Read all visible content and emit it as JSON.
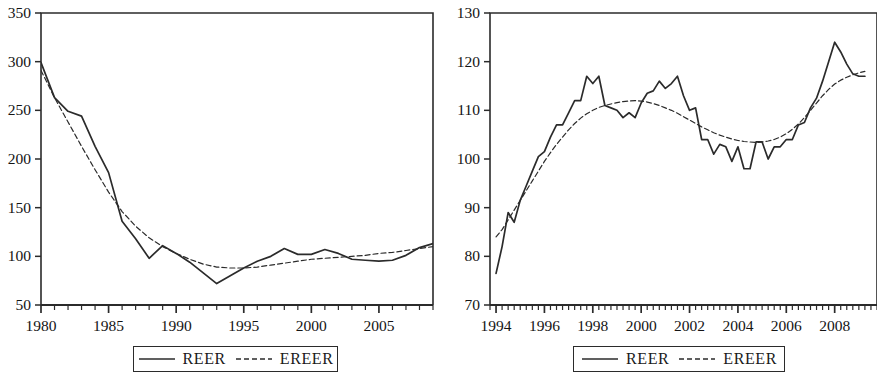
{
  "figure": {
    "background": "#ffffff",
    "line_color": "#2b2b2b",
    "panel_count": 2
  },
  "legend": {
    "series": [
      {
        "label": "REER",
        "style": "solid"
      },
      {
        "label": "EREER",
        "style": "dashed"
      }
    ]
  },
  "chart_data": [
    {
      "type": "line",
      "title": "",
      "xlabel": "",
      "ylabel": "",
      "xlim": [
        1980,
        2009
      ],
      "ylim": [
        50,
        350
      ],
      "grid": false,
      "legend_position": "bottom",
      "ytick_labels": [
        "350",
        "300",
        "250",
        "200",
        "150",
        "100",
        "50"
      ],
      "ytick_values": [
        350,
        300,
        250,
        200,
        150,
        100,
        50
      ],
      "xtick_labels": [
        "1980",
        "1985",
        "1990",
        "1995",
        "2000",
        "2005"
      ],
      "xtick_values": [
        1980,
        1985,
        1990,
        1995,
        2000,
        2005
      ],
      "xtick_minor_step": 1,
      "x": [
        1980,
        1981,
        1982,
        1983,
        1984,
        1985,
        1986,
        1987,
        1988,
        1989,
        1990,
        1991,
        1992,
        1993,
        1994,
        1995,
        1996,
        1997,
        1998,
        1999,
        2000,
        2001,
        2002,
        2003,
        2004,
        2005,
        2006,
        2007,
        2008,
        2009
      ],
      "series": [
        {
          "name": "REER",
          "style": "solid",
          "values": [
            299,
            263,
            249,
            244,
            213,
            186,
            136,
            118,
            98,
            111,
            103,
            94,
            83,
            72,
            80,
            88,
            95,
            100,
            108,
            102,
            102,
            107,
            103,
            97,
            96,
            95,
            96,
            101,
            109,
            113
          ]
        },
        {
          "name": "EREER",
          "style": "dashed",
          "values": [
            291,
            263,
            238,
            213,
            189,
            166,
            146,
            131,
            119,
            110,
            103,
            97,
            92,
            89,
            88,
            88,
            89,
            91,
            93,
            95,
            97,
            98,
            99,
            100,
            101,
            103,
            104,
            106,
            108,
            110
          ]
        }
      ]
    },
    {
      "type": "line",
      "title": "",
      "xlabel": "",
      "ylabel": "",
      "xlim": [
        1993.75,
        2009.75
      ],
      "ylim": [
        70,
        130
      ],
      "grid": false,
      "legend_position": "bottom",
      "ytick_labels": [
        "130",
        "120",
        "110",
        "100",
        "90",
        "80",
        "70"
      ],
      "ytick_values": [
        130,
        120,
        110,
        100,
        90,
        80,
        70
      ],
      "xtick_labels": [
        "1994",
        "1996",
        "1998",
        "2000",
        "2002",
        "2004",
        "2006",
        "2008"
      ],
      "xtick_values": [
        1994,
        1996,
        1998,
        2000,
        2002,
        2004,
        2006,
        2008
      ],
      "xtick_minor_step": 0.25,
      "x": [
        1994.0,
        1994.25,
        1994.5,
        1994.75,
        1995.0,
        1995.25,
        1995.5,
        1995.75,
        1996.0,
        1996.25,
        1996.5,
        1996.75,
        1997.0,
        1997.25,
        1997.5,
        1997.75,
        1998.0,
        1998.25,
        1998.5,
        1998.75,
        1999.0,
        1999.25,
        1999.5,
        1999.75,
        2000.0,
        2000.25,
        2000.5,
        2000.75,
        2001.0,
        2001.25,
        2001.5,
        2001.75,
        2002.0,
        2002.25,
        2002.5,
        2002.75,
        2003.0,
        2003.25,
        2003.5,
        2003.75,
        2004.0,
        2004.25,
        2004.5,
        2004.75,
        2005.0,
        2005.25,
        2005.5,
        2005.75,
        2006.0,
        2006.25,
        2006.5,
        2006.75,
        2007.0,
        2007.25,
        2007.5,
        2007.75,
        2008.0,
        2008.25,
        2008.5,
        2008.75,
        2009.0,
        2009.25
      ],
      "series": [
        {
          "name": "REER",
          "style": "solid",
          "values": [
            76.5,
            82.0,
            89.0,
            87.0,
            91.5,
            94.5,
            97.5,
            100.5,
            101.5,
            104.5,
            107.0,
            107.0,
            109.5,
            112.0,
            112.0,
            117.0,
            115.5,
            117.0,
            111.0,
            110.5,
            110.0,
            108.5,
            109.5,
            108.5,
            111.5,
            113.5,
            114.0,
            116.0,
            114.5,
            115.5,
            117.0,
            113.0,
            110.0,
            110.5,
            104.0,
            104.0,
            101.0,
            103.0,
            102.5,
            99.5,
            102.5,
            98.0,
            98.0,
            103.5,
            103.5,
            100.0,
            102.5,
            102.5,
            104.0,
            104.0,
            107.0,
            107.5,
            110.5,
            112.5,
            116.0,
            120.0,
            124.0,
            122.0,
            119.5,
            117.5,
            117.0,
            117.0
          ]
        },
        {
          "name": "EREER",
          "style": "dashed",
          "values": [
            84.0,
            85.5,
            87.5,
            89.5,
            91.5,
            93.5,
            95.5,
            97.5,
            99.5,
            101.3,
            103.0,
            104.5,
            106.0,
            107.3,
            108.4,
            109.3,
            110.0,
            110.6,
            111.0,
            111.3,
            111.6,
            111.8,
            111.9,
            112.0,
            111.9,
            111.7,
            111.4,
            111.0,
            110.5,
            110.0,
            109.4,
            108.7,
            108.0,
            107.3,
            106.6,
            106.0,
            105.4,
            104.9,
            104.5,
            104.1,
            103.8,
            103.6,
            103.5,
            103.4,
            103.5,
            103.7,
            104.0,
            104.5,
            105.2,
            106.1,
            107.2,
            108.5,
            110.0,
            111.5,
            113.0,
            114.3,
            115.4,
            116.2,
            116.8,
            117.3,
            117.7,
            118.0
          ]
        }
      ]
    }
  ]
}
